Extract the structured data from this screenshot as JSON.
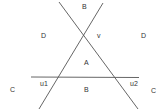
{
  "diagram": {
    "lines": [
      {
        "name": "line-descending",
        "x1": 59,
        "y1": 2,
        "x2": 138,
        "y2": 109
      },
      {
        "name": "line-ascending",
        "x1": 103,
        "y1": 3,
        "x2": 39,
        "y2": 109
      },
      {
        "name": "line-horizontal",
        "x1": 31,
        "y1": 77,
        "x2": 139,
        "y2": 77.5
      }
    ],
    "labels": [
      {
        "name": "label-B-top",
        "text": "B",
        "x": 82,
        "y": 9
      },
      {
        "name": "label-D-left",
        "text": "D",
        "x": 41,
        "y": 38
      },
      {
        "name": "label-v",
        "text": "v",
        "x": 97,
        "y": 38
      },
      {
        "name": "label-D-right",
        "text": "D",
        "x": 141,
        "y": 38
      },
      {
        "name": "label-A",
        "text": "A",
        "x": 84,
        "y": 65
      },
      {
        "name": "label-u1",
        "text": "u1",
        "x": 40,
        "y": 86
      },
      {
        "name": "label-B-bottom",
        "text": "B",
        "x": 84,
        "y": 92
      },
      {
        "name": "label-u2",
        "text": "u2",
        "x": 130,
        "y": 86
      },
      {
        "name": "label-C-left",
        "text": "C",
        "x": 10,
        "y": 92
      },
      {
        "name": "label-C-right",
        "text": "C",
        "x": 151,
        "y": 93
      }
    ]
  }
}
